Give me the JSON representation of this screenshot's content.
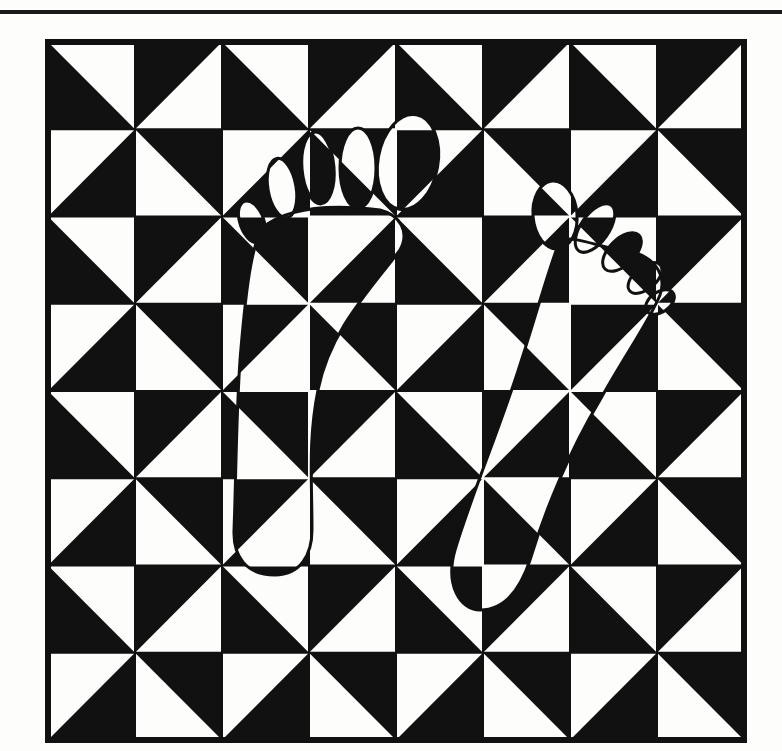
{
  "artwork": {
    "title": "Footprints on pinwheel grid",
    "style": "black-and-white optical illusion",
    "colors": {
      "ink": "#111111",
      "paper": "#fdfdfb"
    },
    "grid": {
      "rows": 8,
      "cols": 8,
      "left": 48,
      "top": 42,
      "right": 744,
      "bottom": 740,
      "pattern": "pinwheel of half-square triangles"
    },
    "figures": [
      {
        "name": "left-footprint",
        "description": "left foot with five toes, heel at lower left"
      },
      {
        "name": "right-footprint",
        "description": "right foot with five toes, angled to upper right"
      }
    ]
  }
}
